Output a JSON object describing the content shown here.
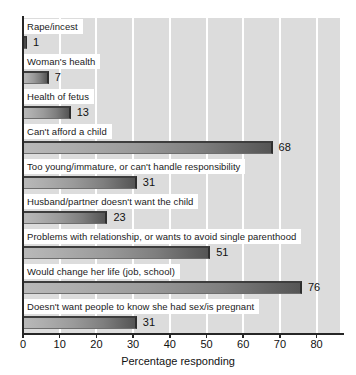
{
  "chart_data": {
    "type": "bar",
    "orientation": "horizontal",
    "title": "",
    "subtitle": "",
    "xlabel": "Percentage responding",
    "ylabel": "",
    "xlim": [
      0,
      80
    ],
    "ylim": null,
    "grid": "vertical-gridlines-only",
    "legend": null,
    "categories": [
      "Rape/incest",
      "Woman's health",
      "Health of fetus",
      "Can't afford a child",
      "Too young/immature, or can't handle responsibility",
      "Husband/partner doesn't want the child",
      "Problems with relationship, or wants to avoid single parenthood",
      "Would change her life (job, school)",
      "Doesn't want people to know she had sex/is pregnant"
    ],
    "values": [
      1,
      7,
      13,
      68,
      31,
      23,
      51,
      76,
      31
    ],
    "value_labels": [
      "1",
      "7",
      "13",
      "68",
      "31",
      "23",
      "51",
      "76",
      "31"
    ],
    "xticks": [
      0,
      10,
      20,
      30,
      40,
      50,
      60,
      70,
      80
    ],
    "xtick_labels": [
      "0",
      "10",
      "20",
      "30",
      "40",
      "50",
      "60",
      "70",
      "80"
    ],
    "colors": {
      "plot_background": "#dcdcdc",
      "gridline": "#ffffff",
      "bar_light": "#b9b9b9",
      "bar_dark": "#555555",
      "bar_edge": "#2e2e2e",
      "axis": "#262626",
      "text": "#111111",
      "label_band": "#ffffff"
    }
  }
}
